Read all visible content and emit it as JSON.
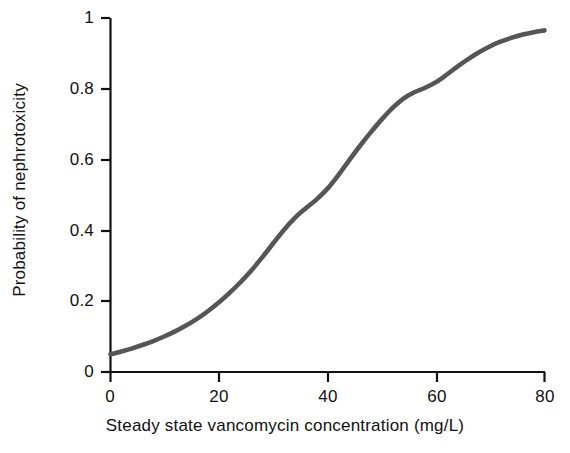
{
  "chart_data": {
    "type": "line",
    "title": "",
    "xlabel": "Steady state vancomycin concentration (mg/L)",
    "ylabel": "Probability of nephrotoxicity",
    "xlim": [
      0,
      80
    ],
    "ylim": [
      0,
      1
    ],
    "xticks": [
      0,
      20,
      40,
      60,
      80
    ],
    "xtick_labels": [
      "0",
      "20",
      "40",
      "60",
      "80"
    ],
    "yticks": [
      0,
      0.2,
      0.4,
      0.6,
      0.8,
      1
    ],
    "ytick_labels": [
      "0",
      "0.2",
      "0.4",
      "0.6",
      "0.8",
      "1"
    ],
    "grid": false,
    "legend": "none",
    "line_color": "#555555",
    "line_width": 4,
    "axis_color": "#111111",
    "background": "#ffffff",
    "series": [
      {
        "name": "Probability of nephrotoxicity",
        "x": [
          0,
          2,
          4,
          6,
          8,
          10,
          12,
          14,
          16,
          18,
          20,
          22,
          24,
          26,
          28,
          30,
          32,
          34,
          36,
          38,
          40,
          42,
          44,
          46,
          48,
          50,
          52,
          54,
          56,
          58,
          60,
          62,
          64,
          66,
          68,
          70,
          72,
          74,
          76,
          78,
          80
        ],
        "y": [
          0.05,
          0.057,
          0.066,
          0.076,
          0.087,
          0.1,
          0.114,
          0.13,
          0.148,
          0.17,
          0.195,
          0.222,
          0.252,
          0.285,
          0.32,
          0.365,
          0.405,
          0.445,
          0.465,
          0.485,
          0.5,
          0.56,
          0.6,
          0.64,
          0.68,
          0.715,
          0.75,
          0.78,
          0.805,
          0.79,
          0.81,
          0.845,
          0.865,
          0.885,
          0.905,
          0.925,
          0.935,
          0.945,
          0.955,
          0.962,
          0.965
        ]
      }
    ],
    "annotations": []
  }
}
